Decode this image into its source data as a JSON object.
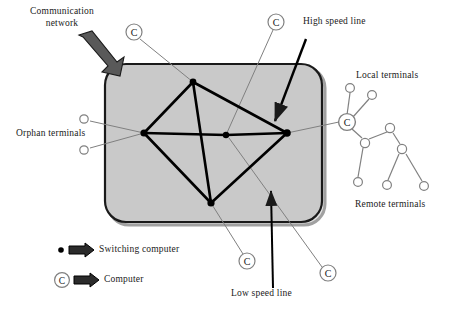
{
  "diagram": {
    "colors": {
      "cloud_fill": "#c9c9c9",
      "cloud_stroke": "#1a1a1a",
      "backbone_line": "#000000",
      "leader_line": "#808080",
      "terminal_stroke": "#808080",
      "text": "#1a1a1a",
      "block_arrow_fill": "#595959"
    },
    "labels": {
      "communication_network": "Communication\nnetwork",
      "communication_network_l1": "Communication",
      "communication_network_l2": "network",
      "orphan_terminals": "Orphan  terminals",
      "high_speed_line": "High speed line",
      "low_speed_line": "Low speed line",
      "local_terminals": "Local  terminals",
      "remote_terminals": "Remote terminals"
    },
    "computer_markers": [
      {
        "id": "c-top-left",
        "label": "C",
        "x": 134,
        "y": 32
      },
      {
        "id": "c-top-right",
        "label": "C",
        "x": 276,
        "y": 22
      },
      {
        "id": "c-bottom-left",
        "label": "C",
        "x": 247,
        "y": 261
      },
      {
        "id": "c-bottom-right",
        "label": "C",
        "x": 328,
        "y": 273
      },
      {
        "id": "c-hub-right",
        "label": "C",
        "x": 347,
        "y": 122
      }
    ],
    "switching_computers": [
      {
        "id": "sw-top",
        "x": 193,
        "y": 82
      },
      {
        "id": "sw-left",
        "x": 144,
        "y": 133
      },
      {
        "id": "sw-center",
        "x": 226,
        "y": 135
      },
      {
        "id": "sw-right",
        "x": 287,
        "y": 133
      },
      {
        "id": "sw-bottom",
        "x": 211,
        "y": 203
      }
    ],
    "orphan_terminal_nodes": [
      {
        "id": "orphan-upper",
        "x": 84,
        "y": 119
      },
      {
        "id": "orphan-lower",
        "x": 84,
        "y": 150
      }
    ],
    "local_terminal_nodes": [
      {
        "id": "local-1",
        "x": 350,
        "y": 88
      },
      {
        "id": "local-2",
        "x": 372,
        "y": 95
      }
    ],
    "remote_terminal_nodes": [
      {
        "id": "remote-branch-1",
        "x": 365,
        "y": 143
      },
      {
        "id": "remote-branch-2",
        "x": 390,
        "y": 128
      },
      {
        "id": "remote-branch-3",
        "x": 402,
        "y": 149
      },
      {
        "id": "remote-leaf-1",
        "x": 358,
        "y": 182
      },
      {
        "id": "remote-leaf-2",
        "x": 387,
        "y": 185
      },
      {
        "id": "remote-leaf-3",
        "x": 424,
        "y": 186
      }
    ]
  },
  "legend": {
    "items": [
      {
        "id": "legend-switching-computer",
        "symbol": "filled-dot",
        "label": "Switching computer"
      },
      {
        "id": "legend-computer",
        "symbol": "circled-c",
        "label": "Computer"
      }
    ]
  }
}
